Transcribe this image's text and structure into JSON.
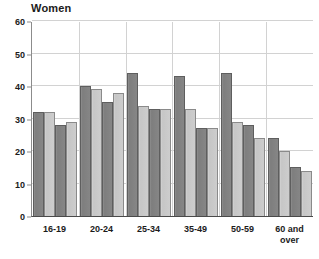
{
  "chart_data": {
    "type": "bar",
    "title": "Women",
    "xlabel": "",
    "ylabel": "",
    "ylim": [
      0,
      60
    ],
    "yticks": [
      0,
      10,
      20,
      30,
      40,
      50,
      60
    ],
    "grid": true,
    "legend": "none",
    "categories": [
      "16-19",
      "20-24",
      "25-34",
      "35-49",
      "50-59",
      "60 and over"
    ],
    "series": [
      {
        "name": "Series 1",
        "values": [
          32,
          40,
          44,
          43,
          44,
          24
        ]
      },
      {
        "name": "Series 2",
        "values": [
          32,
          39,
          34,
          33,
          29,
          20
        ]
      },
      {
        "name": "Series 3",
        "values": [
          28,
          35,
          33,
          27,
          28,
          15
        ]
      },
      {
        "name": "Series 4",
        "values": [
          29,
          38,
          33,
          27,
          24,
          14
        ]
      }
    ],
    "series_colors": [
      "#868686",
      "#cdcdcd",
      "#868686",
      "#cdcdcd"
    ]
  },
  "colors": {
    "dark_bar": "#868686",
    "light_bar": "#cdcdcd",
    "gridline": "#d2d2d2",
    "axis": "#4a4a4a",
    "text": "#1b1b1b",
    "background": "#ffffff"
  }
}
